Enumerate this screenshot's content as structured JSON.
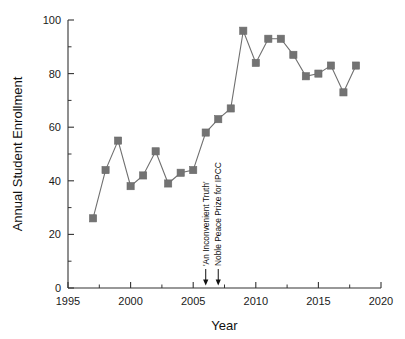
{
  "chart_data": {
    "type": "line",
    "title": "",
    "xlabel": "Year",
    "ylabel": "Annual Student Enrollment",
    "xlim": [
      1995,
      2020
    ],
    "ylim": [
      0,
      100
    ],
    "xticks": [
      1995,
      2000,
      2005,
      2010,
      2015,
      2020
    ],
    "yticks": [
      0,
      20,
      40,
      60,
      80,
      100
    ],
    "xtick_labels": [
      "1995",
      "2000",
      "2005",
      "2010",
      "2015",
      "2020"
    ],
    "ytick_labels": [
      "0",
      "20",
      "40",
      "60",
      "80",
      "100"
    ],
    "grid": false,
    "legend": false,
    "marker": "square",
    "marker_color": "#737373",
    "line_color": "#6f6f6f",
    "x": [
      1997,
      1998,
      1999,
      2000,
      2001,
      2002,
      2003,
      2004,
      2005,
      2006,
      2007,
      2008,
      2009,
      2010,
      2011,
      2012,
      2013,
      2014,
      2015,
      2016,
      2017,
      2018
    ],
    "values": [
      26,
      44,
      55,
      38,
      42,
      51,
      39,
      43,
      44,
      58,
      63,
      67,
      96,
      84,
      93,
      93,
      87,
      79,
      80,
      83,
      73,
      83
    ],
    "series": [
      {
        "name": "Annual Student Enrollment",
        "values": [
          26,
          44,
          55,
          38,
          42,
          51,
          39,
          43,
          44,
          58,
          63,
          67,
          96,
          84,
          93,
          93,
          87,
          79,
          80,
          83,
          73,
          83
        ]
      }
    ],
    "annotations": [
      {
        "label": "'An Inconvenient Truth'",
        "x": 2006,
        "arrow": true
      },
      {
        "label": "Noble Peace Prize for IPCC",
        "x": 2007,
        "arrow": true
      }
    ]
  }
}
